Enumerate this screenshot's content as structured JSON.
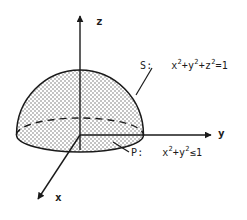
{
  "figure": {
    "background_color": "#ffffff",
    "line_color": "#1a1a1a",
    "surface_fill_color": "#d9d9d9",
    "width": 247,
    "height": 220
  },
  "axes": {
    "z": {
      "label": "z",
      "direction": "up",
      "arrow": true
    },
    "y": {
      "label": "y",
      "direction": "right",
      "arrow": true
    },
    "x": {
      "label": "x",
      "direction": "down-left",
      "arrow": true
    },
    "origin": {
      "x": 80,
      "y": 135
    }
  },
  "annotations": {
    "surface": {
      "name": "S",
      "prefix": "S:",
      "equation_plain": "x²+y²+z²=1",
      "parts": [
        {
          "base": "x",
          "exp": "2"
        },
        {
          "op": "+"
        },
        {
          "base": "y",
          "exp": "2"
        },
        {
          "op": "+"
        },
        {
          "base": "z",
          "exp": "2"
        },
        {
          "op": "=1"
        }
      ],
      "leader_line": true
    },
    "region": {
      "name": "P",
      "prefix": "P:",
      "equation_plain": "x²+y²≤1",
      "parts": [
        {
          "base": "x",
          "exp": "2"
        },
        {
          "op": "+"
        },
        {
          "base": "y",
          "exp": "2"
        },
        {
          "op": "≤1"
        }
      ],
      "leader_line": true
    }
  },
  "chart_data": {
    "type": "diagram",
    "elements": [
      {
        "kind": "hemisphere",
        "label": "S",
        "equation": "x^2+y^2+z^2=1",
        "shaded": true
      },
      {
        "kind": "disk",
        "label": "P",
        "equation": "x^2+y^2<=1",
        "boundary_style": "dashed-back/solid-front"
      },
      {
        "kind": "axis",
        "label": "z"
      },
      {
        "kind": "axis",
        "label": "y"
      },
      {
        "kind": "axis",
        "label": "x"
      }
    ]
  }
}
